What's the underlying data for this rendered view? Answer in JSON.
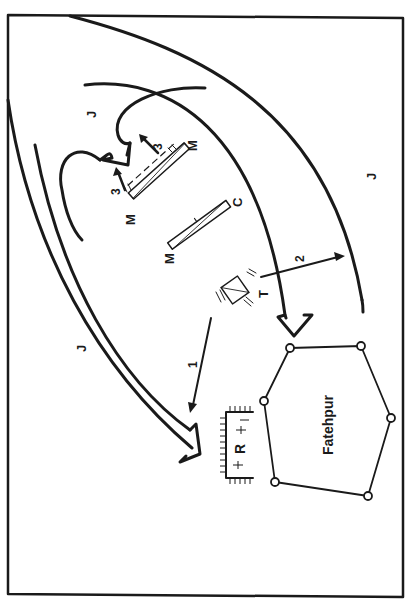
{
  "diagram": {
    "town_label": "Fatehpur",
    "colors": {
      "ink": "#1a1a1a",
      "paper": "#ffffff"
    },
    "labels": {
      "j_top_left": "J",
      "j_right": "J",
      "j_left": "J",
      "m_top_right": "M",
      "m_top_left": "M",
      "m_center": "M",
      "c_center": "C",
      "t_position": "T",
      "r_position": "R",
      "arrow_3a": "3",
      "arrow_3b": "3",
      "arrow_1": "1",
      "arrow_2": "2"
    }
  }
}
